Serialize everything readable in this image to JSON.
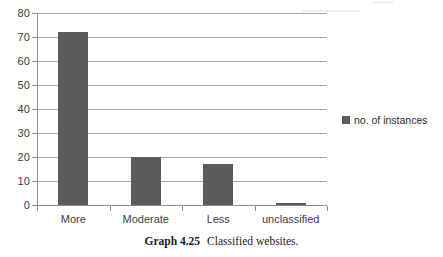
{
  "chart_data": {
    "type": "bar",
    "title": "",
    "xlabel": "",
    "ylabel": "",
    "categories": [
      "More",
      "Moderate",
      "Less",
      "unclassified"
    ],
    "values": [
      72,
      20,
      17,
      1
    ],
    "series": [
      {
        "name": "no. of instances",
        "values": [
          72,
          20,
          17,
          1
        ],
        "color": "#5b5b5b"
      }
    ],
    "ylim": [
      0,
      80
    ],
    "yticks": [
      0,
      10,
      20,
      30,
      40,
      50,
      60,
      70,
      80
    ],
    "ytick_labels": [
      "0",
      "10",
      "20",
      "30",
      "40",
      "50",
      "60",
      "70",
      "80"
    ],
    "grid": true,
    "grid_axis": "y",
    "legend_position": "right",
    "legend_entries": [
      "no. of instances"
    ],
    "bar_color": "#5b5b5b",
    "gridline_color": "#a6a6a6",
    "axis_color": "#8c8c8c",
    "background": "#ffffff"
  },
  "legend": {
    "label": "no. of instances",
    "swatch_icon": "legend-square-icon",
    "color": "#5b5b5b"
  },
  "caption": {
    "number": "Graph 4.25",
    "text": "Classified websites."
  }
}
